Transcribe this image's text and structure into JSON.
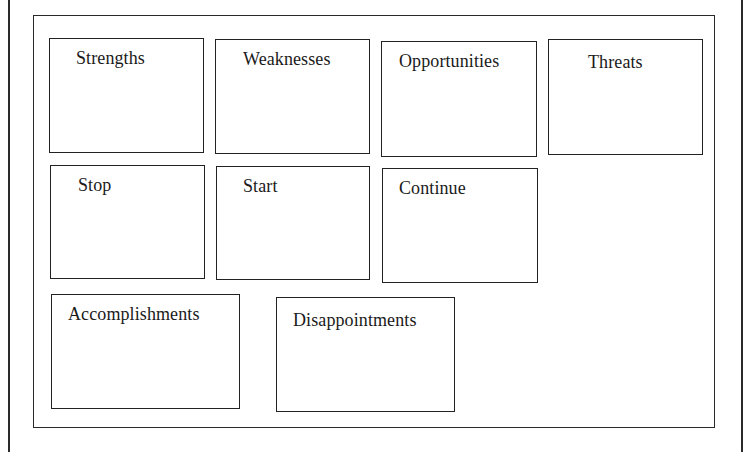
{
  "diagram": {
    "type": "retrospective-template-grid",
    "rows": [
      {
        "row": 1,
        "boxes": [
          {
            "id": "strengths",
            "label": "Strengths"
          },
          {
            "id": "weaknesses",
            "label": "Weaknesses"
          },
          {
            "id": "opportunities",
            "label": "Opportunities"
          },
          {
            "id": "threats",
            "label": "Threats"
          }
        ]
      },
      {
        "row": 2,
        "boxes": [
          {
            "id": "stop",
            "label": "Stop"
          },
          {
            "id": "start",
            "label": "Start"
          },
          {
            "id": "continue",
            "label": "Continue"
          }
        ]
      },
      {
        "row": 3,
        "boxes": [
          {
            "id": "accomplishments",
            "label": "Accomplishments"
          },
          {
            "id": "disappointments",
            "label": "Disappointments"
          }
        ]
      }
    ],
    "colors": {
      "border": "#222222",
      "text": "#1a1a1a",
      "background": "#ffffff"
    }
  }
}
